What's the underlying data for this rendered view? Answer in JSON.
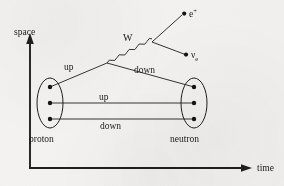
{
  "diagram": {
    "title_text": "",
    "background_color": "#f4f3f1",
    "ink_color": "#1f1f1f",
    "axes": {
      "vertical_label": "space",
      "horizontal_label": "time",
      "origin": [
        30,
        168
      ],
      "vertical_tip": [
        30,
        38
      ],
      "horizontal_tip": [
        252,
        168
      ]
    },
    "particles": {
      "initial_hadron": "proton",
      "final_hadron": "neutron",
      "emitted_lepton": "e",
      "emitted_lepton_superscript": "+",
      "emitted_neutrino": "ν",
      "emitted_neutrino_subscript": "e",
      "boson": "W"
    },
    "quark_lines": [
      {
        "label": "up",
        "position": "upper-left",
        "x": 72,
        "y": 67
      },
      {
        "label": "down",
        "position": "upper-right",
        "x": 140,
        "y": 70
      },
      {
        "label": "up",
        "position": "middle",
        "x": 108,
        "y": 100
      },
      {
        "label": "down",
        "position": "lower",
        "x": 116,
        "y": 124
      }
    ],
    "vertices": {
      "quark_vertex": [
        107,
        63
      ],
      "boson_vertex": [
        152,
        42
      ],
      "positron_endpoint": [
        186,
        13
      ],
      "neutrino_endpoint": [
        188,
        54
      ]
    },
    "hadrons": [
      {
        "name": "proton",
        "label": "proton",
        "ellipse": {
          "cx": 50,
          "cy": 103,
          "rx": 13,
          "ry": 25
        },
        "quark_dots": [
          [
            50,
            87
          ],
          [
            50,
            103
          ],
          [
            50,
            119
          ]
        ],
        "label_x": 50,
        "label_y": 141
      },
      {
        "name": "neutron",
        "label": "neutron",
        "ellipse": {
          "cx": 194,
          "cy": 103,
          "rx": 13,
          "ry": 25
        },
        "quark_dots": [
          [
            194,
            87
          ],
          [
            194,
            103
          ],
          [
            194,
            119
          ]
        ],
        "label_x": 196,
        "label_y": 141
      }
    ],
    "process_description": "beta-plus decay: proton -> neutron + positron + electron neutrino"
  }
}
